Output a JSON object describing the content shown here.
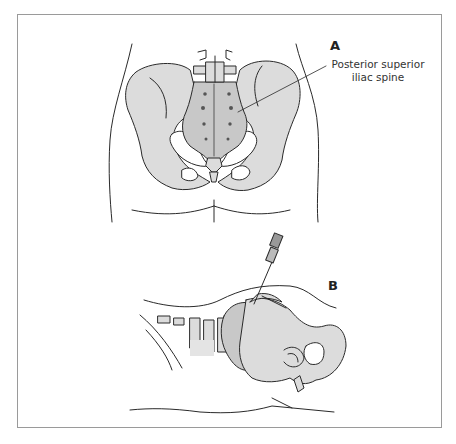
{
  "figure": {
    "panels": [
      {
        "id": "A",
        "label": "A",
        "view": "posterior view of pelvis",
        "callouts": [
          {
            "text_line1": "Posterior superior",
            "text_line2": "iliac spine"
          }
        ]
      },
      {
        "id": "B",
        "label": "B",
        "view": "lateral view with needle inserted at sacrum"
      }
    ],
    "colors": {
      "bone_fill": "#dcdcdc",
      "sacrum_fill": "#c8c8c8",
      "outline": "#2a2a2a",
      "frame": "#9a9a9a"
    }
  }
}
